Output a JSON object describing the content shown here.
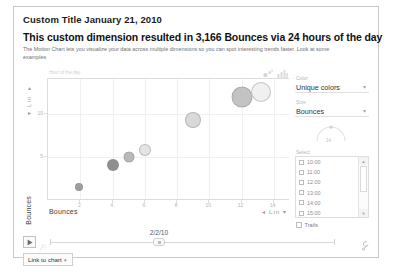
{
  "header": {
    "custom_title": "Custom Title January 21, 2010",
    "headline": "This custom dimension resulted in 3,166 Bounces via 24 hours of the day",
    "description": "The Motion Chart lets you visualize your data across multiple dimensions so you can spot interesting trends faster. Look at some examples"
  },
  "chart_data": {
    "type": "scatter",
    "title": "",
    "series_label": "Hour of the day",
    "xlabel": "Bounces",
    "ylabel": "Bounces",
    "xlim": [
      0,
      15
    ],
    "ylim": [
      0,
      14
    ],
    "xticks": [
      "2",
      "4",
      "6",
      "8",
      "10",
      "12",
      "14"
    ],
    "xtick_values": [
      2,
      4,
      6,
      8,
      10,
      12,
      14
    ],
    "yticks": [
      "5",
      "10"
    ],
    "ytick_values": [
      5,
      10
    ],
    "grid": true,
    "x_scale": "Lin",
    "y_scale": "Lin",
    "points": [
      {
        "x": 1.9,
        "y": 1.6,
        "size": 8,
        "color": "#9e9e9e"
      },
      {
        "x": 4.0,
        "y": 4.1,
        "size": 12,
        "color": "#8f8f8f"
      },
      {
        "x": 5.0,
        "y": 5.0,
        "size": 11,
        "color": "#b9b9b9"
      },
      {
        "x": 6.0,
        "y": 5.8,
        "size": 12,
        "color": "#e4e4e4"
      },
      {
        "x": 9.0,
        "y": 9.3,
        "size": 16,
        "color": "#d9d9d9"
      },
      {
        "x": 12.0,
        "y": 11.9,
        "size": 21,
        "color": "#c3c3c3"
      },
      {
        "x": 13.2,
        "y": 12.5,
        "size": 20,
        "color": "#f0f0f0"
      }
    ]
  },
  "chart_toolbar": {
    "bubble_chart_icon": "bubble-chart-icon",
    "bar_chart_icon": "bar-chart-icon"
  },
  "axis": {
    "y_title": "Bounces",
    "y_scale_label": "Lin",
    "x_title": "Bounces",
    "x_scale_label": "Lin",
    "caret": "▾",
    "caret_left": "◂"
  },
  "side_panel": {
    "color_label": "Color",
    "color_value": "Unique colors",
    "size_label": "Size",
    "size_value": "Bounces",
    "size_arc_value": "14",
    "select_label": "Select",
    "options": [
      "10:00",
      "11:00",
      "12:00",
      "13:00",
      "14:00",
      "15:00"
    ],
    "trails_label": "Trails",
    "caret": "▾",
    "scroll_up": "▲",
    "scroll_down": "▼"
  },
  "timeline": {
    "play_icon": "play-icon",
    "speed_icon": "speed-icon",
    "date": "2/2/10",
    "settings_icon": "wrench-icon"
  },
  "footer": {
    "link_to_chart": "Link to chart",
    "caret": "▾"
  }
}
